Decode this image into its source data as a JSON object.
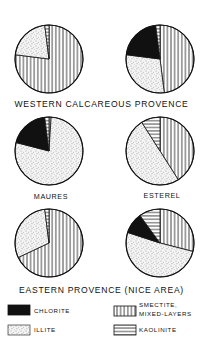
{
  "chart_data": {
    "type": "pie",
    "legend": [
      {
        "key": "chlorite",
        "label": "CHLORITE",
        "pattern": "solid-black"
      },
      {
        "key": "illite",
        "label": "ILLITE",
        "pattern": "stipple"
      },
      {
        "key": "smectite",
        "label": "SMECTITE, MIXED-LAYERS",
        "label_line1": "SMECTITE,",
        "label_line2": "MIXED-LAYERS",
        "pattern": "vertical-lines"
      },
      {
        "key": "kaolinite",
        "label": "KAOLINITE",
        "pattern": "horizontal-lines"
      }
    ],
    "groups": [
      {
        "title": "WESTERN CALCAREOUS PROVENCE",
        "pies": [
          {
            "label": "",
            "slices": [
              {
                "mineral": "smectite",
                "value": 77
              },
              {
                "mineral": "illite",
                "value": 21
              },
              {
                "mineral": "kaolinite",
                "value": 2
              }
            ]
          },
          {
            "label": "",
            "slices": [
              {
                "mineral": "smectite",
                "value": 48
              },
              {
                "mineral": "illite",
                "value": 29
              },
              {
                "mineral": "chlorite",
                "value": 21
              },
              {
                "mineral": "kaolinite",
                "value": 2
              }
            ]
          }
        ]
      },
      {
        "title": "",
        "pies": [
          {
            "label": "MAURES",
            "slices": [
              {
                "mineral": "smectite",
                "value": 1
              },
              {
                "mineral": "illite",
                "value": 78
              },
              {
                "mineral": "chlorite",
                "value": 19
              },
              {
                "mineral": "kaolinite",
                "value": 2
              }
            ]
          },
          {
            "label": "ESTEREL",
            "slices": [
              {
                "mineral": "smectite",
                "value": 41
              },
              {
                "mineral": "illite",
                "value": 50
              },
              {
                "mineral": "kaolinite",
                "value": 9
              }
            ]
          }
        ]
      },
      {
        "title": "EASTERN PROVENCE (NICE AREA)",
        "pies": [
          {
            "label": "",
            "slices": [
              {
                "mineral": "smectite",
                "value": 68
              },
              {
                "mineral": "illite",
                "value": 30
              },
              {
                "mineral": "kaolinite",
                "value": 2
              }
            ]
          },
          {
            "label": "",
            "slices": [
              {
                "mineral": "smectite",
                "value": 29
              },
              {
                "mineral": "illite",
                "value": 51
              },
              {
                "mineral": "chlorite",
                "value": 10
              },
              {
                "mineral": "kaolinite",
                "value": 10
              }
            ]
          }
        ]
      }
    ],
    "units": "percent",
    "slice_order": "clockwise from 12 o'clock"
  },
  "titles": {
    "western": "WESTERN CALCAREOUS PROVENCE",
    "eastern": "EASTERN PROVENCE (NICE AREA)"
  },
  "labels": {
    "maures": "MAURES",
    "esterel": "ESTEREL"
  },
  "legend": {
    "chlorite": "CHLORITE",
    "illite": "ILLITE",
    "smectite_line1": "SMECTITE,",
    "smectite_line2": "MIXED-LAYERS",
    "kaolinite": "KAOLINITE"
  },
  "colors": {
    "ink": "#111111",
    "paper": "#ffffff"
  }
}
